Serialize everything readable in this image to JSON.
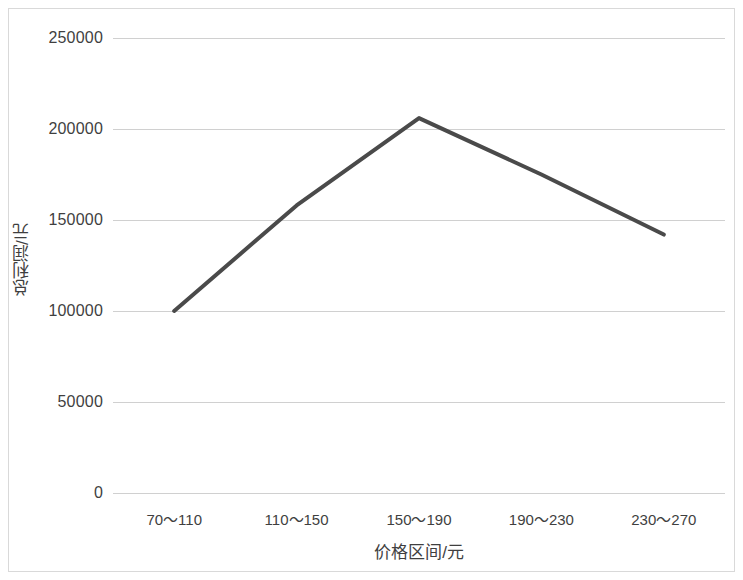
{
  "chart_data": {
    "type": "line",
    "title": "",
    "subtitle": "",
    "xlabel": "价格区间/元",
    "ylabel": "总利润/元",
    "categories": [
      "70～110",
      "110～150",
      "150～190",
      "190～230",
      "230～270"
    ],
    "values": [
      100000,
      158000,
      206000,
      175000,
      142000
    ],
    "series": [
      {
        "name": "总利润",
        "values": [
          100000,
          158000,
          206000,
          175000,
          142000
        ]
      }
    ],
    "ylim": [
      0,
      250000
    ],
    "ytick_step": 50000,
    "ytick_labels": [
      "0",
      "50000",
      "100000",
      "150000",
      "200000",
      "250000"
    ],
    "ytick_values": [
      0,
      50000,
      100000,
      150000,
      200000,
      250000
    ],
    "xtick_labels": [
      "70～110",
      "110～150",
      "150～190",
      "190～230",
      "230～270"
    ],
    "grid": "horizontal",
    "legend": "none",
    "line_color": "#4a4a4a",
    "gridline_color": "#d0d0d0",
    "border_color": "#d9d9d9",
    "text_color": "#3f3f3f",
    "markers": false,
    "line_width": 4
  }
}
